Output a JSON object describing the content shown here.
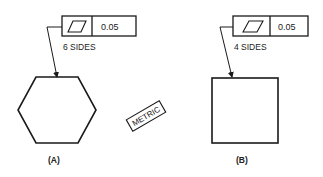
{
  "figure_a": {
    "symbol": "flatness-parallelogram-icon",
    "tolerance": "0.05",
    "note": "6 SIDES",
    "caption": "(A)",
    "shape": "hexagon"
  },
  "figure_b": {
    "symbol": "flatness-parallelogram-icon",
    "tolerance": "0.05",
    "note": "4 SIDES",
    "caption": "(B)",
    "shape": "square"
  },
  "stamp": {
    "label": "METRIC"
  },
  "colors": {
    "line": "#1a1a1a",
    "background": "#ffffff"
  }
}
